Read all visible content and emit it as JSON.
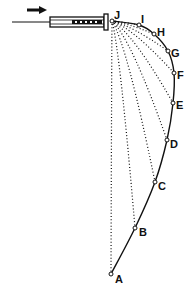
{
  "diagram": {
    "arrow_direction": "right",
    "line_color": "#111111",
    "background": "#ffffff",
    "points": [
      {
        "id": "J",
        "label": "J"
      },
      {
        "id": "I",
        "label": "I"
      },
      {
        "id": "H",
        "label": "H"
      },
      {
        "id": "G",
        "label": "G"
      },
      {
        "id": "F",
        "label": "F"
      },
      {
        "id": "E",
        "label": "E"
      },
      {
        "id": "D",
        "label": "D"
      },
      {
        "id": "C",
        "label": "C"
      },
      {
        "id": "B",
        "label": "B"
      },
      {
        "id": "A",
        "label": "A"
      }
    ]
  }
}
